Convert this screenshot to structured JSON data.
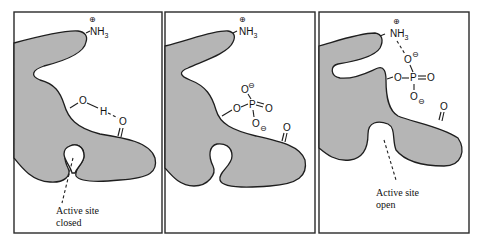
{
  "figure": {
    "fill_color": "#b5b5b5",
    "stroke_color": "#1e1e1e"
  },
  "panels": [
    {
      "id": "closed",
      "amine": {
        "label": "NH",
        "subscript": "3",
        "charge": "+"
      },
      "hydroxyl": {
        "o": "O",
        "h": "H",
        "acceptor": "O",
        "interaction": "hydrogen bond"
      },
      "active_site_label": [
        "Active site",
        "closed"
      ]
    },
    {
      "id": "phosphorylated",
      "amine": {
        "label": "NH",
        "subscript": "3",
        "charge": "+"
      },
      "phosphate": {
        "ester_o": "O",
        "p": "P",
        "double_o": "O",
        "top_o": "O",
        "bottom_o": "O",
        "charge": "−"
      },
      "carbonyl": "O"
    },
    {
      "id": "open",
      "amine": {
        "label": "NH",
        "subscript": "3",
        "charge": "+"
      },
      "phosphate": {
        "ester_o": "O",
        "p": "P",
        "double_o": "O",
        "top_o": "O",
        "bottom_o": "O",
        "charge": "−"
      },
      "carbonyl": "O",
      "active_site_label": [
        "Active site",
        "open"
      ]
    }
  ]
}
